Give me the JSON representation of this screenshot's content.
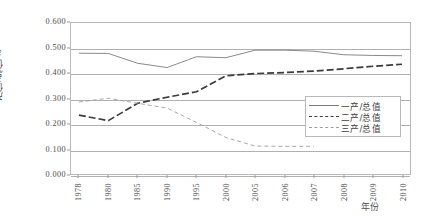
{
  "chart_data": {
    "type": "line",
    "title": "",
    "xlabel": "年份",
    "ylabel": "产值/总值/%",
    "categories": [
      "1978",
      "1980",
      "1985",
      "1990",
      "1995",
      "2000",
      "2005",
      "2006",
      "2007",
      "2008",
      "2009",
      "2010"
    ],
    "ylim": [
      0.0,
      0.6
    ],
    "ytick_labels": [
      "0.600",
      "0.500",
      "0.400",
      "0.300",
      "0.200",
      "0.100",
      "0.000"
    ],
    "ytick_values": [
      0.6,
      0.5,
      0.4,
      0.3,
      0.2,
      0.1,
      0.0
    ],
    "grid": true,
    "legend_position": "inside-right",
    "series": [
      {
        "name": "一产/总值",
        "style": "solid",
        "color": "#7a7a7a",
        "values": [
          0.48,
          0.479,
          0.44,
          0.423,
          0.466,
          0.462,
          0.492,
          0.492,
          0.488,
          0.474,
          0.471,
          0.47
        ]
      },
      {
        "name": "二产/总值",
        "style": "dashed",
        "color": "#3a3a3a",
        "values": [
          0.234,
          0.212,
          0.281,
          0.305,
          0.327,
          0.39,
          0.399,
          0.403,
          0.409,
          0.418,
          0.428,
          0.436
        ]
      },
      {
        "name": "三产/总值",
        "style": "fine-dashed",
        "color": "#9d9d9d",
        "values": [
          0.286,
          0.301,
          0.281,
          0.262,
          0.205,
          0.145,
          0.111,
          0.11,
          0.11,
          null,
          null,
          null
        ]
      }
    ]
  },
  "legend": {
    "items": [
      {
        "label": "一产/总值"
      },
      {
        "label": "二产/总值"
      },
      {
        "label": "三产/总值"
      }
    ]
  },
  "axes": {
    "y_title": "产值/总值/%",
    "x_title": "年份"
  }
}
